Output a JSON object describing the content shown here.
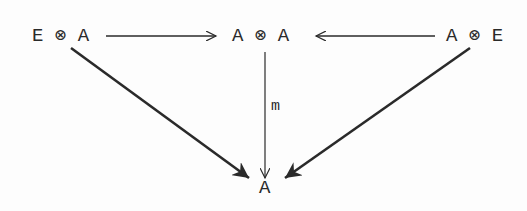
{
  "diagram": {
    "type": "commutative-diagram",
    "nodes": {
      "left": "E ⊗ A",
      "center": "A ⊗ A",
      "right": "A ⊗ E",
      "bottom": "A"
    },
    "edges": [
      {
        "from": "left",
        "to": "center",
        "label": "",
        "style": "thin",
        "head": "open"
      },
      {
        "from": "right",
        "to": "center",
        "label": "",
        "style": "thin",
        "head": "open"
      },
      {
        "from": "center",
        "to": "bottom",
        "label": "m",
        "style": "thin",
        "head": "open"
      },
      {
        "from": "left",
        "to": "bottom",
        "label": "",
        "style": "bold",
        "head": "filled"
      },
      {
        "from": "right",
        "to": "bottom",
        "label": "",
        "style": "bold",
        "head": "filled"
      }
    ],
    "labels": {
      "m": "m"
    },
    "colors": {
      "ink": "#2a2a2a",
      "background": "#fdfdfd"
    }
  }
}
